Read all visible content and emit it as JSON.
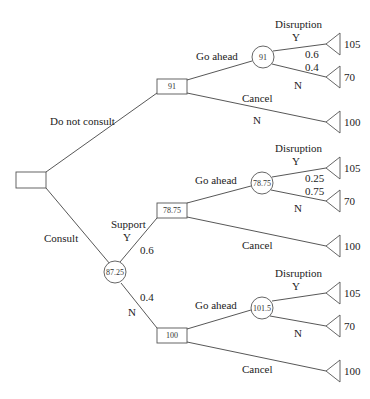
{
  "diagram": {
    "title": "",
    "root": {
      "type": "decision",
      "value": ""
    },
    "branches": {
      "do_not_consult": {
        "label": "Do not consult",
        "decision_value": "91",
        "go_ahead": {
          "label": "Go ahead",
          "chance_value": "91",
          "event_label": "Disruption",
          "yes": {
            "label": "Y",
            "prob": "0.6",
            "payoff": "105"
          },
          "no": {
            "label": "N",
            "prob": "0.4",
            "payoff": "70"
          }
        },
        "cancel": {
          "label": "Cancel",
          "sublabel": "N",
          "payoff": "100"
        }
      },
      "consult": {
        "label": "Consult",
        "chance_value": "87.25",
        "support_label": "Support",
        "support_yes": {
          "label": "Y",
          "prob": "0.6",
          "decision_value": "78.75",
          "go_ahead": {
            "label": "Go ahead",
            "chance_value": "78.75",
            "event_label": "Disruption",
            "yes": {
              "label": "Y",
              "prob": "0.25",
              "payoff": "105"
            },
            "no": {
              "label": "N",
              "prob": "0.75",
              "payoff": "70"
            }
          },
          "cancel": {
            "label": "Cancel",
            "payoff": "100"
          }
        },
        "support_no": {
          "label": "N",
          "prob": "0.4",
          "decision_value": "100",
          "go_ahead": {
            "label": "Go ahead",
            "chance_value": "101.5",
            "event_label": "Disruption",
            "yes": {
              "label": "Y",
              "payoff": "105"
            },
            "no": {
              "label": "N",
              "payoff": "70"
            }
          },
          "cancel": {
            "label": "Cancel",
            "payoff": "100"
          }
        }
      }
    }
  }
}
